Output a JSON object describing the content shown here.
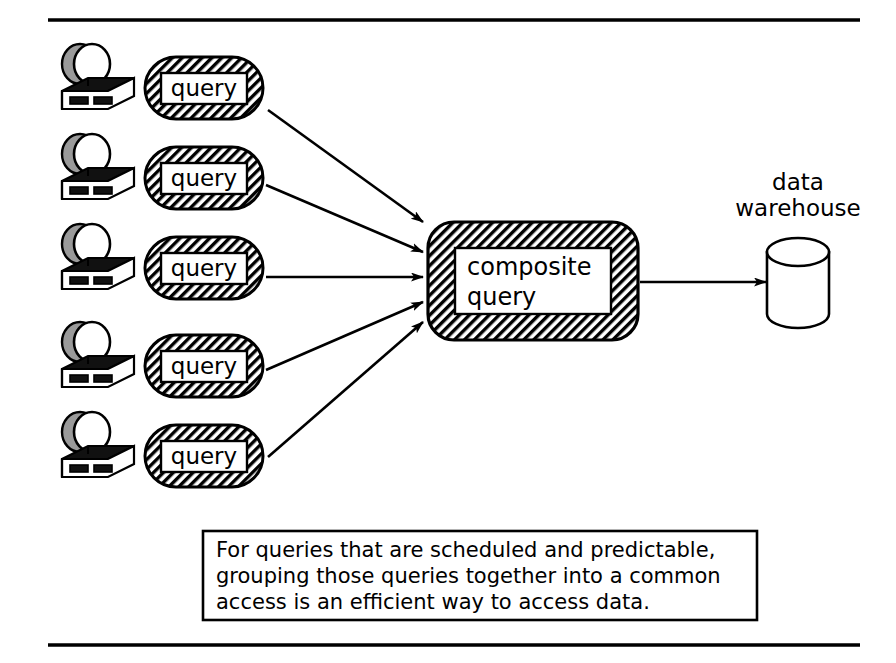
{
  "figure": {
    "title_rule_top": true,
    "title_rule_bottom": true,
    "colors": {
      "ink": "#000000",
      "paper": "#ffffff",
      "hatch": "#000000",
      "shade": "#9a9a9a"
    },
    "sources": [
      {
        "id": 1,
        "workstation_label": "workstation",
        "query_label": "query"
      },
      {
        "id": 2,
        "workstation_label": "workstation",
        "query_label": "query"
      },
      {
        "id": 3,
        "workstation_label": "workstation",
        "query_label": "query"
      },
      {
        "id": 4,
        "workstation_label": "workstation",
        "query_label": "query"
      },
      {
        "id": 5,
        "workstation_label": "workstation",
        "query_label": "query"
      }
    ],
    "composite": {
      "label_line1": "composite",
      "label_line2": "query"
    },
    "warehouse": {
      "label_line1": "data",
      "label_line2": "warehouse",
      "shape": "cylinder-icon"
    },
    "caption": {
      "line1": "For queries that are scheduled and predictable,",
      "line2": "grouping those queries together into a common",
      "line3": "access is an efficient way to access data."
    }
  }
}
